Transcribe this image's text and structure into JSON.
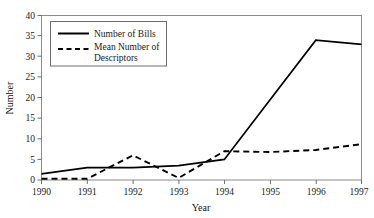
{
  "chart_data": {
    "type": "line",
    "title": "",
    "subtitle": "",
    "xlabel": "Year",
    "ylabel": "Number",
    "categories": [
      "1990",
      "1991",
      "1992",
      "1993",
      "1994",
      "1995",
      "1996",
      "1997"
    ],
    "x": [
      1990,
      1991,
      1992,
      1993,
      1994,
      1995,
      1996,
      1997
    ],
    "xlim": [
      1990,
      1997
    ],
    "ylim": [
      0,
      40
    ],
    "y_ticks": [
      0,
      5,
      10,
      15,
      20,
      25,
      30,
      35,
      40
    ],
    "y_tick_labels": [
      "0",
      "5",
      "10",
      "15",
      "20",
      "25",
      "30",
      "35",
      "40"
    ],
    "x_ticks": [
      1990,
      1991,
      1992,
      1993,
      1994,
      1995,
      1996,
      1997
    ],
    "x_tick_labels": [
      "1990",
      "1991",
      "1992",
      "1993",
      "1994",
      "1995",
      "1996",
      "1997"
    ],
    "grid": false,
    "legend_position": "upper-left-inside",
    "series": [
      {
        "name": "Number of Bills",
        "style": "solid",
        "color": "#000000",
        "values": [
          1.5,
          3,
          3,
          3.5,
          5,
          19.5,
          34,
          33
        ]
      },
      {
        "name": "Mean Number of Descriptors",
        "style": "dashed",
        "color": "#000000",
        "values": [
          0.3,
          0.3,
          6,
          0.5,
          7,
          6.8,
          7.3,
          8.7
        ]
      }
    ],
    "annotations": []
  },
  "legend": {
    "entries": [
      {
        "label": "Number of Bills",
        "style": "solid"
      },
      {
        "label": "Mean Number of",
        "label_line2": "Descriptors",
        "style": "dashed"
      }
    ],
    "entry_0_label": "Number of Bills",
    "entry_1_label_line1": "Mean Number of",
    "entry_1_label_line2": "Descriptors"
  },
  "axes": {
    "y_title": "Number",
    "x_title": "Year",
    "y_labels": {
      "t0": "0",
      "t5": "5",
      "t10": "10",
      "t15": "15",
      "t20": "20",
      "t25": "25",
      "t30": "30",
      "t35": "35",
      "t40": "40"
    },
    "x_labels": {
      "t1990": "1990",
      "t1991": "1991",
      "t1992": "1992",
      "t1993": "1993",
      "t1994": "1994",
      "t1995": "1995",
      "t1996": "1996",
      "t1997": "1997"
    }
  }
}
